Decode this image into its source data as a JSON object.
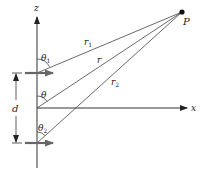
{
  "diagram": {
    "axes": {
      "z_label": "z",
      "x_label": "x"
    },
    "point": {
      "label": "P"
    },
    "distances": {
      "r1_label": "r",
      "r1_sub": "1",
      "r_label": "r",
      "r2_label": "r",
      "r2_sub": "2"
    },
    "angles": {
      "theta1_label": "θ",
      "theta1_sub": "1",
      "theta_label": "θ",
      "theta2_label": "θ",
      "theta2_sub": "2"
    },
    "separation": {
      "label": "d"
    },
    "colors": {
      "line": "#444444",
      "dipole": "#666666",
      "point": "#111111"
    }
  }
}
